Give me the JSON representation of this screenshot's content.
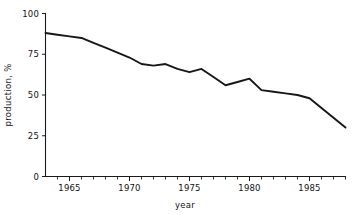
{
  "chart_data": {
    "type": "line",
    "title": "",
    "xlabel": "year",
    "ylabel": "production, %",
    "xlim": [
      1963,
      1988
    ],
    "ylim": [
      0,
      100
    ],
    "grid": false,
    "legend": false,
    "legend_position": "none",
    "line_color": "#15171a",
    "background_color": "#ffffff",
    "axis_color": "#1a1a1a",
    "x_ticks_major": [
      1965,
      1970,
      1975,
      1980,
      1985
    ],
    "x_tick_labels": [
      "1965",
      "1970",
      "1975",
      "1980",
      "1985"
    ],
    "x_ticks_minor": [
      1964,
      1966,
      1967,
      1968,
      1969,
      1971,
      1972,
      1973,
      1974,
      1976,
      1977,
      1978,
      1979,
      1981,
      1982,
      1983,
      1984,
      1986,
      1987,
      1988
    ],
    "y_ticks": [
      0,
      25,
      50,
      75,
      100
    ],
    "y_tick_labels": [
      "0",
      "25",
      "50",
      "75",
      "100"
    ],
    "x": [
      1963,
      1964,
      1965,
      1966,
      1967,
      1968,
      1969,
      1970,
      1971,
      1972,
      1973,
      1974,
      1975,
      1976,
      1977,
      1978,
      1979,
      1980,
      1981,
      1982,
      1983,
      1984,
      1985,
      1986,
      1987,
      1988
    ],
    "values": [
      88,
      87,
      86,
      85,
      82,
      79,
      76,
      73,
      69,
      68,
      69,
      66,
      64,
      66,
      61,
      56,
      58,
      60,
      53,
      52,
      51,
      50,
      48,
      42,
      36,
      30
    ],
    "series": [
      {
        "name": "production",
        "values": [
          88,
          87,
          86,
          85,
          82,
          79,
          76,
          73,
          69,
          68,
          69,
          66,
          64,
          66,
          61,
          56,
          58,
          60,
          53,
          52,
          51,
          50,
          48,
          42,
          36,
          30
        ]
      }
    ]
  }
}
